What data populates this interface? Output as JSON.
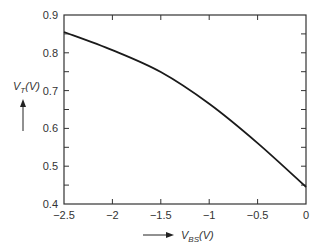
{
  "chart_data": {
    "type": "line",
    "title": "",
    "xlabel": "V_BS(V)",
    "ylabel": "V_T(V)",
    "xlabel_main": "V",
    "xlabel_sub": "BS",
    "xlabel_unit": "(V)",
    "ylabel_main": "V",
    "ylabel_sub": "T",
    "ylabel_unit": "(V)",
    "xlim": [
      -2.5,
      0
    ],
    "ylim": [
      0.4,
      0.9
    ],
    "x_ticks": [
      -2.5,
      -2,
      -1.5,
      -1,
      -0.5,
      0
    ],
    "x_tick_labels": [
      "−2.5",
      "−2",
      "−1.5",
      "−1",
      "−0.5",
      "0"
    ],
    "y_ticks": [
      0.4,
      0.5,
      0.6,
      0.7,
      0.8,
      0.9
    ],
    "y_tick_labels": [
      "0.4",
      "0.5",
      "0.6",
      "0.7",
      "0.8",
      "0.9"
    ],
    "grid": false,
    "legend": null,
    "series": [
      {
        "name": "V_T vs V_BS",
        "color": "#1a1a1a",
        "x": [
          -2.5,
          -2.0,
          -1.5,
          -1.0,
          -0.5,
          0.0
        ],
        "values": [
          0.855,
          0.807,
          0.749,
          0.665,
          0.561,
          0.445
        ]
      }
    ]
  }
}
